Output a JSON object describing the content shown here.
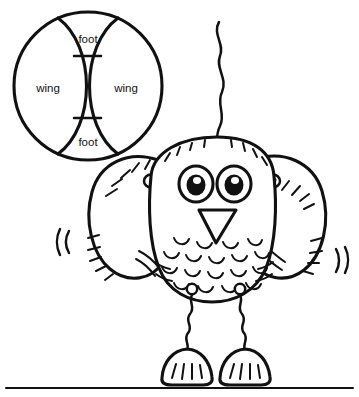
{
  "page": {
    "background_color": "#ffffff",
    "ink_color": "#111111",
    "width": 359,
    "height": 397
  },
  "diagram": {
    "name": "parts-circle-diagram",
    "shape": "circle-with-two-overlapping-lens-regions",
    "center": {
      "x": 88,
      "y": 86
    },
    "radius": 74,
    "labels": [
      {
        "id": "foot-top",
        "text": "foot",
        "x": 88,
        "y": 40
      },
      {
        "id": "wing-left",
        "text": "wing",
        "x": 48,
        "y": 89
      },
      {
        "id": "wing-right",
        "text": "wing",
        "x": 126,
        "y": 89
      },
      {
        "id": "foot-bottom",
        "text": "foot",
        "x": 88,
        "y": 143
      }
    ]
  },
  "owl": {
    "name": "owl-figure",
    "parts": [
      {
        "id": "antenna",
        "label": "antenna-feather"
      },
      {
        "id": "head-body",
        "label": "head-and-body"
      },
      {
        "id": "left-wing",
        "label": "left-wing"
      },
      {
        "id": "right-wing",
        "label": "right-wing"
      },
      {
        "id": "left-eye",
        "label": "left-eye"
      },
      {
        "id": "right-eye",
        "label": "right-eye"
      },
      {
        "id": "beak",
        "label": "beak"
      },
      {
        "id": "belly",
        "label": "belly-feathers"
      },
      {
        "id": "left-leg",
        "label": "left-leg"
      },
      {
        "id": "right-leg",
        "label": "right-leg"
      },
      {
        "id": "left-foot",
        "label": "left-foot"
      },
      {
        "id": "right-foot",
        "label": "right-foot"
      },
      {
        "id": "motion-left",
        "label": "motion-marks-left"
      },
      {
        "id": "motion-right",
        "label": "motion-marks-right"
      }
    ]
  },
  "ground": {
    "name": "ground-line",
    "y": 388,
    "x_start": 6,
    "x_end": 353
  }
}
